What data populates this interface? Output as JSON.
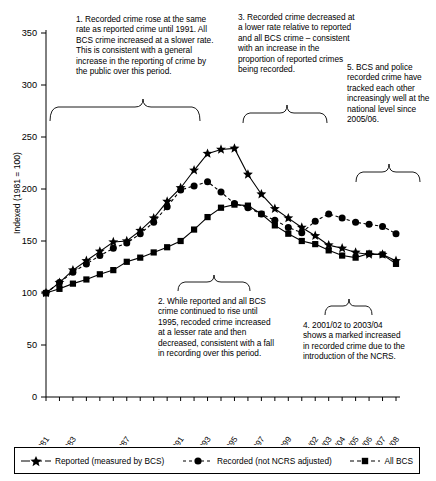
{
  "chart_data": {
    "type": "line",
    "title": "",
    "xlabel": "",
    "ylabel": "Indexed (1981 = 100)",
    "ylim": [
      0,
      360
    ],
    "yticks": [
      0,
      50,
      100,
      150,
      200,
      250,
      300,
      350
    ],
    "grid": false,
    "legend_position": "bottom",
    "categories": [
      "1981",
      "1982",
      "1983",
      "1984",
      "1985",
      "1986",
      "1987",
      "1988",
      "1989",
      "1990",
      "1991",
      "1992",
      "1993",
      "1994",
      "1995",
      "1996",
      "1997",
      "1998",
      "1999",
      "2000/01",
      "2001/02",
      "2002/03",
      "2003/04",
      "2004/05",
      "2005/06",
      "2006/07",
      "2007/08"
    ],
    "tick_labels": [
      "1981",
      "",
      "1983",
      "",
      "",
      "",
      "1987",
      "",
      "",
      "",
      "1991",
      "",
      "1993",
      "",
      "1995",
      "",
      "1997",
      "",
      "1999",
      "",
      "2001/02",
      "2002/03",
      "2003/04",
      "2004/05",
      "2005/06",
      "2006/07",
      "2007/08"
    ],
    "series": [
      {
        "name": "Reported (measured by BCS)",
        "marker": "star",
        "linestyle": "solid",
        "color": "#000000",
        "values": [
          100,
          110,
          122,
          131,
          140,
          149,
          150,
          160,
          172,
          188,
          201,
          218,
          234,
          238,
          239,
          214,
          195,
          181,
          172,
          163,
          155,
          146,
          143,
          139,
          137,
          137,
          131
        ]
      },
      {
        "name": "Recorded (not NCRS adjusted)",
        "marker": "circle",
        "linestyle": "dashed",
        "color": "#000000",
        "values": [
          100,
          110,
          120,
          128,
          136,
          143,
          148,
          157,
          168,
          183,
          199,
          203,
          207,
          197,
          186,
          182,
          176,
          170,
          163,
          158,
          169,
          176,
          172,
          168,
          166,
          164,
          157
        ]
      },
      {
        "name": "All BCS",
        "marker": "square",
        "linestyle": "solid",
        "color": "#000000",
        "values": [
          100,
          104,
          109,
          113,
          118,
          122,
          130,
          134,
          139,
          144,
          150,
          161,
          173,
          182,
          185,
          184,
          176,
          165,
          157,
          150,
          147,
          141,
          136,
          134,
          138,
          137,
          128
        ]
      }
    ],
    "annotations": [
      {
        "id": 1,
        "text": "1. Recorded crime rose at the same rate as reported crime until 1991. All BCS crime increased at a slower rate. This is consistent with a general increase in the reporting of crime by the public over this period."
      },
      {
        "id": 2,
        "text": "2. While reported and all BCS crime continued to rise until 1995, recoded crime increased at a lesser rate and then decreased, consistent with a fall in recording over this period."
      },
      {
        "id": 3,
        "text": "3. Recorded crime decreased at a lower rate relative to reported and all BCS crime – consistent with an increase in the proportion of reported crimes being recorded."
      },
      {
        "id": 4,
        "text": "4. 2001/02 to 2003/04 shows a marked increased in recorded crime due to the introduction of the NCRS."
      },
      {
        "id": 5,
        "text": "5. BCS and police recorded crime have tracked each other increasingly well at the national level since 2005/06."
      }
    ]
  },
  "legend": {
    "items": [
      {
        "label": "Reported (measured by BCS)",
        "marker": "star-marker",
        "linestyle": "solid"
      },
      {
        "label": "Recorded (not NCRS adjusted)",
        "marker": "circle-marker",
        "linestyle": "dashed"
      },
      {
        "label": "All BCS",
        "marker": "square-marker",
        "linestyle": "dashed"
      }
    ]
  }
}
